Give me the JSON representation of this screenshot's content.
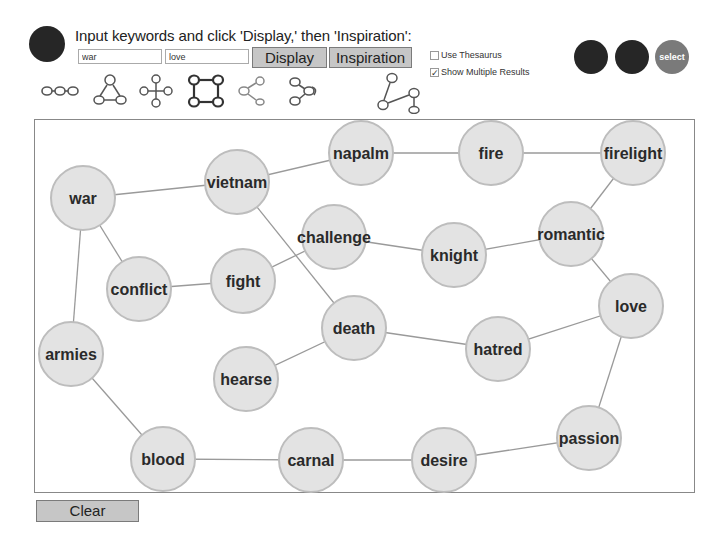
{
  "header": {
    "instructions": "Input keywords and click 'Display,' then 'Inspiration':",
    "keyword1": "war",
    "keyword2": "love",
    "display_label": "Display",
    "inspiration_label": "Inspiration",
    "use_thesaurus_label": "Use Thesaurus",
    "use_thesaurus_checked": false,
    "show_multiple_label": "Show Multiple Results",
    "show_multiple_checked": true,
    "select_label": "select"
  },
  "layout_icons": [
    {
      "name": "chain-layout-icon"
    },
    {
      "name": "triangle-layout-icon"
    },
    {
      "name": "cross-layout-icon"
    },
    {
      "name": "square-layout-icon"
    },
    {
      "name": "branch-layout-icon"
    },
    {
      "name": "curl-layout-icon"
    },
    {
      "name": "zigzag-layout-icon"
    }
  ],
  "graph": {
    "nodes": [
      {
        "id": "war",
        "label": "war",
        "x": 48,
        "y": 78
      },
      {
        "id": "vietnam",
        "label": "vietnam",
        "x": 202,
        "y": 62
      },
      {
        "id": "napalm",
        "label": "napalm",
        "x": 326,
        "y": 33
      },
      {
        "id": "fire",
        "label": "fire",
        "x": 456,
        "y": 33
      },
      {
        "id": "firelight",
        "label": "firelight",
        "x": 598,
        "y": 33
      },
      {
        "id": "challenge",
        "label": "challenge",
        "x": 299,
        "y": 117
      },
      {
        "id": "knight",
        "label": "knight",
        "x": 419,
        "y": 135
      },
      {
        "id": "romantic",
        "label": "romantic",
        "x": 536,
        "y": 114
      },
      {
        "id": "conflict",
        "label": "conflict",
        "x": 104,
        "y": 169
      },
      {
        "id": "fight",
        "label": "fight",
        "x": 208,
        "y": 161
      },
      {
        "id": "love",
        "label": "love",
        "x": 596,
        "y": 186
      },
      {
        "id": "death",
        "label": "death",
        "x": 319,
        "y": 208
      },
      {
        "id": "hatred",
        "label": "hatred",
        "x": 463,
        "y": 229
      },
      {
        "id": "armies",
        "label": "armies",
        "x": 36,
        "y": 234
      },
      {
        "id": "hearse",
        "label": "hearse",
        "x": 211,
        "y": 259
      },
      {
        "id": "blood",
        "label": "blood",
        "x": 128,
        "y": 339
      },
      {
        "id": "carnal",
        "label": "carnal",
        "x": 276,
        "y": 340
      },
      {
        "id": "desire",
        "label": "desire",
        "x": 409,
        "y": 340
      },
      {
        "id": "passion",
        "label": "passion",
        "x": 554,
        "y": 318
      }
    ],
    "edges": [
      [
        "war",
        "vietnam"
      ],
      [
        "war",
        "conflict"
      ],
      [
        "war",
        "armies"
      ],
      [
        "vietnam",
        "napalm"
      ],
      [
        "vietnam",
        "death"
      ],
      [
        "napalm",
        "fire"
      ],
      [
        "fire",
        "firelight"
      ],
      [
        "firelight",
        "romantic"
      ],
      [
        "challenge",
        "fight"
      ],
      [
        "challenge",
        "knight"
      ],
      [
        "knight",
        "romantic"
      ],
      [
        "romantic",
        "love"
      ],
      [
        "conflict",
        "fight"
      ],
      [
        "death",
        "hearse"
      ],
      [
        "death",
        "hatred"
      ],
      [
        "hatred",
        "love"
      ],
      [
        "love",
        "passion"
      ],
      [
        "armies",
        "blood"
      ],
      [
        "blood",
        "carnal"
      ],
      [
        "carnal",
        "desire"
      ],
      [
        "desire",
        "passion"
      ]
    ],
    "node_radius": 32,
    "node_fill": "#e3e3e3",
    "node_stroke": "#bdbdbd",
    "edge_color": "#9a9a9a"
  },
  "footer": {
    "clear_label": "Clear"
  }
}
